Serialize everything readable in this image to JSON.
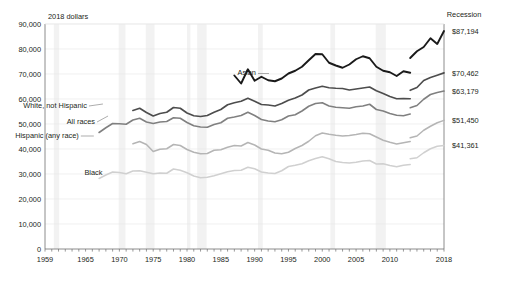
{
  "chart_data": {
    "type": "line",
    "title": "",
    "subtitle": "",
    "ylabel": "2018 dollars",
    "xlabel": "",
    "ylim": [
      0,
      90000
    ],
    "xlim": [
      1959,
      2018
    ],
    "grid": true,
    "legend_position": "inline-annotations",
    "y_ticks": [
      "0",
      "10,000",
      "20,000",
      "30,000",
      "40,000",
      "50,000",
      "60,000",
      "70,000",
      "80,000",
      "90,000"
    ],
    "y_tick_values": [
      0,
      10000,
      20000,
      30000,
      40000,
      50000,
      60000,
      70000,
      80000,
      90000
    ],
    "x_ticks": [
      "1959",
      "1965",
      "1970",
      "1975",
      "1980",
      "1985",
      "1990",
      "1995",
      "2000",
      "2005",
      "2010",
      "2018"
    ],
    "x_tick_values": [
      1959,
      1965,
      1970,
      1975,
      1980,
      1985,
      1990,
      1995,
      2000,
      2005,
      2010,
      2018
    ],
    "annotations": [
      {
        "text": "Recession",
        "x": 2014.5,
        "y": 92500
      },
      {
        "text": "2018 dollars",
        "x": 1960,
        "y": 93000
      }
    ],
    "series": [
      {
        "name": "Asian",
        "label": "Asian",
        "color": "#1a1a1a",
        "width": 1.9,
        "label_x": 1990.2,
        "label_y": 70600,
        "end_label": "$87,194",
        "end_value": 87194,
        "x": [
          1987,
          1988,
          1989,
          1990,
          1991,
          1992,
          1993,
          1994,
          1995,
          1996,
          1997,
          1998,
          1999,
          2000,
          2001,
          2002,
          2003,
          2004,
          2005,
          2006,
          2007,
          2008,
          2009,
          2010,
          2011,
          2012,
          2013
        ],
        "values": [
          69400,
          66200,
          71900,
          67300,
          68900,
          67500,
          67100,
          68200,
          70200,
          71300,
          72900,
          75500,
          78000,
          77900,
          74500,
          73400,
          72500,
          73800,
          75900,
          77100,
          76300,
          72900,
          71300,
          70700,
          69200,
          71100,
          70500
        ],
        "x2": [
          2013,
          2014,
          2015,
          2016,
          2017,
          2018
        ],
        "values2": [
          76400,
          79100,
          80800,
          84300,
          82000,
          87194
        ]
      },
      {
        "name": "White, not Hispanic",
        "label": "White, not Hispanic",
        "color": "#4d4d4d",
        "width": 1.7,
        "label_x": 1965.2,
        "label_y": 57600,
        "end_label": "$70,462",
        "end_value": 70462,
        "x": [
          1972,
          1973,
          1974,
          1975,
          1976,
          1977,
          1978,
          1979,
          1980,
          1981,
          1982,
          1983,
          1984,
          1985,
          1986,
          1987,
          1988,
          1989,
          1990,
          1991,
          1992,
          1993,
          1994,
          1995,
          1996,
          1997,
          1998,
          1999,
          2000,
          2001,
          2002,
          2003,
          2004,
          2005,
          2006,
          2007,
          2008,
          2009,
          2010,
          2011,
          2012,
          2013
        ],
        "values": [
          55400,
          56300,
          54600,
          53200,
          54200,
          54700,
          56600,
          56300,
          54400,
          53300,
          53000,
          53400,
          54700,
          55800,
          57700,
          58500,
          59100,
          60300,
          59100,
          57800,
          57600,
          57200,
          58200,
          59500,
          60400,
          61600,
          63600,
          64400,
          65100,
          64500,
          64300,
          64200,
          63600,
          64000,
          64400,
          64800,
          63300,
          62200,
          61000,
          60100,
          60200,
          60100
        ],
        "x2": [
          2013,
          2014,
          2015,
          2016,
          2017,
          2018
        ],
        "values2": [
          63500,
          64600,
          67400,
          68600,
          69500,
          70462
        ]
      },
      {
        "name": "All races",
        "label": "All races",
        "color": "#808080",
        "width": 1.6,
        "label_x": 1966.4,
        "label_y": 51200,
        "end_label": "$63,179",
        "end_value": 63179,
        "x": [
          1967,
          1968,
          1969,
          1970,
          1971,
          1972,
          1973,
          1974,
          1975,
          1976,
          1977,
          1978,
          1979,
          1980,
          1981,
          1982,
          1983,
          1984,
          1985,
          1986,
          1987,
          1988,
          1989,
          1990,
          1991,
          1992,
          1993,
          1994,
          1995,
          1996,
          1997,
          1998,
          1999,
          2000,
          2001,
          2002,
          2003,
          2004,
          2005,
          2006,
          2007,
          2008,
          2009,
          2010,
          2011,
          2012,
          2013
        ],
        "values": [
          46600,
          48500,
          50200,
          50100,
          49900,
          51600,
          52300,
          50800,
          50200,
          50800,
          51000,
          52500,
          52300,
          50600,
          49300,
          48800,
          48700,
          49800,
          50500,
          52300,
          52800,
          53400,
          54700,
          53400,
          51800,
          51200,
          50900,
          51700,
          53200,
          53700,
          55200,
          57100,
          58200,
          58500,
          57200,
          56700,
          56500,
          56300,
          56900,
          57200,
          57900,
          55800,
          55200,
          54200,
          53500,
          53300,
          54000
        ],
        "x2": [
          2013,
          2014,
          2015,
          2016,
          2017,
          2018
        ],
        "values2": [
          56500,
          57400,
          59900,
          61800,
          62600,
          63179
        ]
      },
      {
        "name": "Hispanic (any race)",
        "label": "Hispanic (any race)",
        "color": "#b5b5b5",
        "width": 1.5,
        "label_x": 1964.0,
        "label_y": 45600,
        "end_label": "$51,450",
        "end_value": 51450,
        "x": [
          1972,
          1973,
          1974,
          1975,
          1976,
          1977,
          1978,
          1979,
          1980,
          1981,
          1982,
          1983,
          1984,
          1985,
          1986,
          1987,
          1988,
          1989,
          1990,
          1991,
          1992,
          1993,
          1994,
          1995,
          1996,
          1997,
          1998,
          1999,
          2000,
          2001,
          2002,
          2003,
          2004,
          2005,
          2006,
          2007,
          2008,
          2009,
          2010,
          2011,
          2012,
          2013
        ],
        "values": [
          42100,
          43000,
          41800,
          39000,
          39900,
          40100,
          41800,
          41400,
          39800,
          38700,
          38100,
          38200,
          39500,
          39700,
          40700,
          41400,
          41200,
          42600,
          41600,
          40000,
          39500,
          38400,
          38100,
          38700,
          40200,
          41400,
          43100,
          45300,
          46400,
          45900,
          45500,
          45200,
          45400,
          45800,
          46300,
          46100,
          44800,
          43500,
          42700,
          42000,
          42500,
          43000
        ],
        "x2": [
          2013,
          2014,
          2015,
          2016,
          2017,
          2018
        ],
        "values2": [
          44500,
          45200,
          47500,
          49100,
          50500,
          51450
        ]
      },
      {
        "name": "Black",
        "label": "Black",
        "color": "#d0d0d0",
        "width": 1.5,
        "label_x": 1967.5,
        "label_y": 30600,
        "end_label": "$41,361",
        "end_value": 41361,
        "x": [
          1967,
          1968,
          1969,
          1970,
          1971,
          1972,
          1973,
          1974,
          1975,
          1976,
          1977,
          1978,
          1979,
          1980,
          1981,
          1982,
          1983,
          1984,
          1985,
          1986,
          1987,
          1988,
          1989,
          1990,
          1991,
          1992,
          1993,
          1994,
          1995,
          1996,
          1997,
          1998,
          1999,
          2000,
          2001,
          2002,
          2003,
          2004,
          2005,
          2006,
          2007,
          2008,
          2009,
          2010,
          2011,
          2012,
          2013
        ],
        "values": [
          28200,
          29600,
          30800,
          30600,
          30100,
          31200,
          31300,
          30700,
          30100,
          30400,
          30300,
          32000,
          31500,
          30500,
          29200,
          28500,
          28700,
          29300,
          30100,
          30900,
          31400,
          31500,
          32700,
          32100,
          30800,
          30400,
          30200,
          31300,
          33000,
          33500,
          34100,
          35300,
          36200,
          36900,
          36100,
          35000,
          34600,
          34400,
          34700,
          35200,
          35400,
          34000,
          34100,
          33400,
          32900,
          33500,
          33800
        ],
        "x2": [
          2013,
          2014,
          2015,
          2016,
          2017,
          2018
        ],
        "values2": [
          36100,
          36500,
          38500,
          40100,
          41100,
          41361
        ]
      }
    ],
    "recessions": [
      {
        "start": 1960.3,
        "end": 1961.1
      },
      {
        "start": 1969.9,
        "end": 1970.9
      },
      {
        "start": 1973.9,
        "end": 1975.2
      },
      {
        "start": 1980.0,
        "end": 1980.5
      },
      {
        "start": 1981.5,
        "end": 1982.9
      },
      {
        "start": 1990.5,
        "end": 1991.2
      },
      {
        "start": 2001.2,
        "end": 2001.9
      },
      {
        "start": 2007.9,
        "end": 2009.4
      }
    ]
  }
}
